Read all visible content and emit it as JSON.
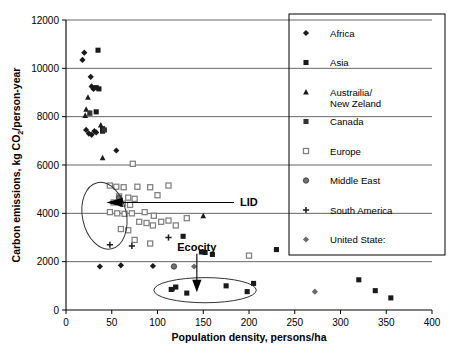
{
  "chart_data": {
    "type": "scatter",
    "title": "",
    "xlabel": "Population density, persons/ha",
    "ylabel_prefix": "Carbon emissions, kg CO",
    "ylabel_sub": "2",
    "ylabel_suffix": "/person-year",
    "xlim": [
      0,
      400
    ],
    "ylim": [
      0,
      12000
    ],
    "xticks": [
      0,
      50,
      100,
      150,
      200,
      250,
      300,
      350,
      400
    ],
    "yticks": [
      0,
      2000,
      4000,
      6000,
      8000,
      10000,
      12000
    ],
    "grid": "horizontal",
    "legend_position": "right",
    "series": [
      {
        "name": "Africa",
        "marker": "filled-diamond",
        "color": "#1a1a1a",
        "points": [
          [
            20,
            10650
          ],
          [
            18,
            10350
          ],
          [
            27,
            9650
          ],
          [
            28,
            9250
          ],
          [
            30,
            9150
          ],
          [
            22,
            7450
          ],
          [
            25,
            7300
          ],
          [
            28,
            7250
          ],
          [
            31,
            7400
          ],
          [
            33,
            7350
          ],
          [
            55,
            6600
          ],
          [
            37,
            1800
          ],
          [
            60,
            1850
          ],
          [
            95,
            1820
          ]
        ]
      },
      {
        "name": "Asia",
        "marker": "filled-square",
        "color": "#1a1a1a",
        "points": [
          [
            35,
            10750
          ],
          [
            33,
            9200
          ],
          [
            36,
            9150
          ],
          [
            33,
            8200
          ],
          [
            40,
            7500
          ],
          [
            40,
            7400
          ],
          [
            128,
            3050
          ],
          [
            148,
            2400
          ],
          [
            152,
            2380
          ],
          [
            160,
            2300
          ],
          [
            205,
            1100
          ],
          [
            230,
            2500
          ],
          [
            320,
            1250
          ],
          [
            338,
            800
          ],
          [
            355,
            500
          ],
          [
            175,
            1000
          ],
          [
            120,
            950
          ],
          [
            132,
            700
          ],
          [
            198,
            760
          ],
          [
            115,
            850
          ]
        ]
      },
      {
        "name": "Austrailia/New Zeland",
        "marker": "filled-triangle",
        "color": "#1a1a1a",
        "points": [
          [
            24,
            8800
          ],
          [
            22,
            8300
          ],
          [
            21,
            8050
          ],
          [
            26,
            8150
          ],
          [
            38,
            7650
          ],
          [
            40,
            6300
          ],
          [
            150,
            3900
          ]
        ]
      },
      {
        "name": "Canada",
        "marker": "filled-square",
        "color": "#333333",
        "points": [
          [
            26,
            8150
          ],
          [
            42,
            7450
          ]
        ]
      },
      {
        "name": "Europe",
        "marker": "open-square",
        "color": "#808080",
        "points": [
          [
            73,
            6050
          ],
          [
            48,
            5150
          ],
          [
            55,
            5100
          ],
          [
            63,
            5080
          ],
          [
            78,
            5100
          ],
          [
            92,
            5080
          ],
          [
            112,
            5150
          ],
          [
            58,
            4700
          ],
          [
            68,
            4650
          ],
          [
            75,
            4600
          ],
          [
            100,
            4750
          ],
          [
            52,
            4450
          ],
          [
            62,
            4400
          ],
          [
            70,
            4350
          ],
          [
            48,
            4050
          ],
          [
            56,
            4000
          ],
          [
            64,
            3980
          ],
          [
            72,
            4000
          ],
          [
            86,
            4050
          ],
          [
            96,
            3900
          ],
          [
            80,
            3650
          ],
          [
            88,
            3600
          ],
          [
            95,
            3500
          ],
          [
            104,
            3650
          ],
          [
            112,
            3700
          ],
          [
            120,
            3500
          ],
          [
            132,
            3800
          ],
          [
            60,
            3350
          ],
          [
            68,
            3300
          ],
          [
            75,
            2900
          ],
          [
            92,
            2750
          ],
          [
            200,
            2250
          ]
        ]
      },
      {
        "name": "Middle East",
        "marker": "gray-circle",
        "color": "#707070",
        "points": [
          [
            118,
            1800
          ],
          [
            58,
            4650
          ]
        ]
      },
      {
        "name": "South America",
        "marker": "plus",
        "color": "#1a1a1a",
        "points": [
          [
            48,
            2700
          ],
          [
            112,
            3000
          ],
          [
            72,
            2650
          ],
          [
            118,
            900
          ]
        ]
      },
      {
        "name": "United State:",
        "marker": "gray-diamond",
        "color": "#6a6a6a",
        "points": [
          [
            140,
            1800
          ],
          [
            272,
            760
          ]
        ]
      }
    ],
    "annotations": [
      {
        "label": "LID",
        "x": 188,
        "y": 4450
      },
      {
        "label": "Ecocity",
        "x": 143,
        "y": 2450
      }
    ],
    "highlight_ellipses": [
      {
        "name": "lid-ellipse",
        "cx": 42,
        "cy": 3900,
        "rx": 24,
        "ry": 1400,
        "rotate": -12
      },
      {
        "name": "ecocity-ellipse",
        "cx": 152,
        "cy": 820,
        "rx": 56,
        "ry": 520,
        "rotate": 0
      }
    ]
  }
}
